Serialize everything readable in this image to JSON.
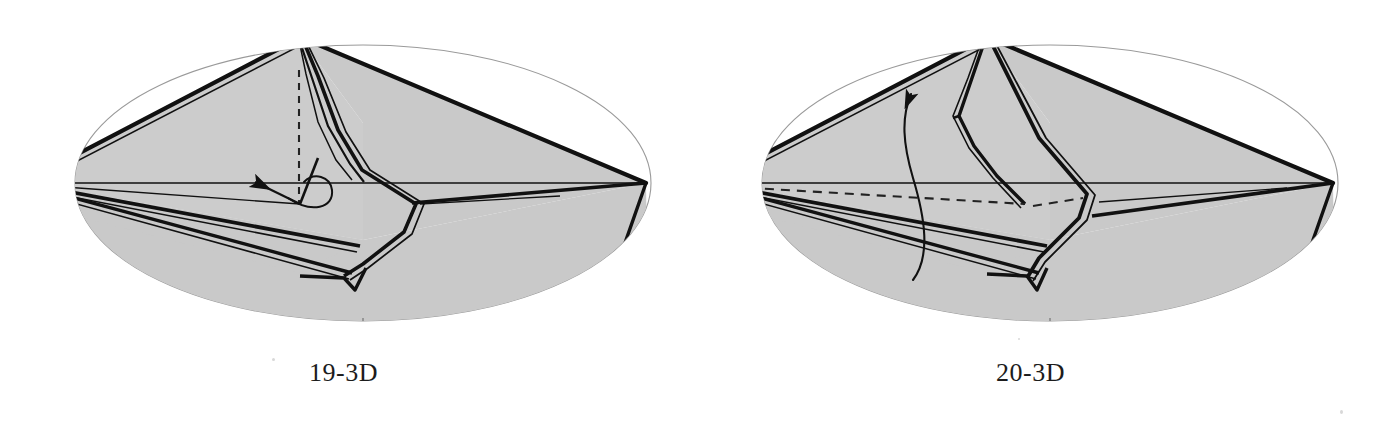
{
  "document": {
    "kind": "origami-folding-diagram-pair",
    "background_color": "#ffffff",
    "width": 1374,
    "height": 448
  },
  "palette": {
    "paper_gray": "#c9c9c9",
    "paper_gray_light": "#d2d2d2",
    "ink_black": "#111111",
    "ellipse_outline": "#9a9a9a",
    "caption_color": "#1c1c1c",
    "tick_color": "#8a8a8a"
  },
  "figures": [
    {
      "id": "figure-19-3d",
      "caption": "19-3D",
      "step_number": "19",
      "view": "3D",
      "ellipse": {
        "cx": 363,
        "cy": 165,
        "rx": 288,
        "ry": 138
      },
      "bottom_tick": {
        "x": 363,
        "y_top": 300,
        "y_bottom": 320
      },
      "annotations": {
        "dashed_vertical_axis": true,
        "dashed_horizontal_axis": false,
        "straight_arrow_left": true,
        "curved_arrow_up": false,
        "loop_curl": true
      },
      "description": "Shaded cone-like 3D paper model with a raised central peak, a dashed vertical fold axis, and a straight arrow pointing left with a small looping curl indicating a twist."
    },
    {
      "id": "figure-20-3d",
      "caption": "20-3D",
      "step_number": "20",
      "view": "3D",
      "ellipse": {
        "cx": 363,
        "cy": 165,
        "rx": 288,
        "ry": 138
      },
      "bottom_tick": {
        "x": 363,
        "y_top": 300,
        "y_bottom": 320
      },
      "annotations": {
        "dashed_vertical_axis": false,
        "dashed_horizontal_axis": true,
        "straight_arrow_left": false,
        "curved_arrow_up": true,
        "loop_curl": false
      },
      "description": "Shaded cone-like 3D paper model with an open diamond-shaped central flap, a dashed horizontal hidden edge, and a long curved arrow sweeping upward to the left."
    }
  ]
}
